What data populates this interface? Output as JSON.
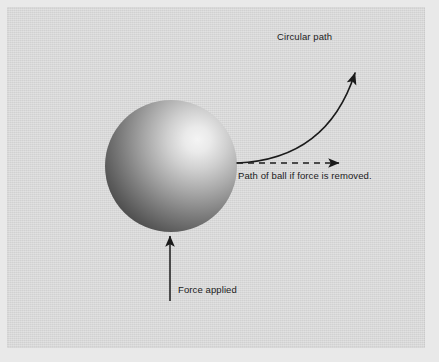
{
  "figure": {
    "type": "physics-diagram",
    "background_color": "#d6d6d6",
    "mat_color": "#e9e9e9",
    "ink_color": "#1b1b1b"
  },
  "labels": {
    "circular_path": "Circular path",
    "tangent_path": "Path of ball if force is removed.",
    "force_applied": "Force applied"
  },
  "ball": {
    "name": "ball",
    "center_x": 171,
    "center_y": 166,
    "radius": 66,
    "highlight_x": 198,
    "highlight_y": 128,
    "highlight_color": "#f2f2f2",
    "mid_color": "#9a9a9a",
    "edge_color": "#4a4a4a"
  },
  "arrows": {
    "circular_path": {
      "name": "circular-path-arrow",
      "style": "solid-curved",
      "start_x": 237,
      "start_y": 163,
      "end_x": 361,
      "end_y": 60,
      "color": "#1b1b1b"
    },
    "tangent_path": {
      "name": "tangent-path-arrow",
      "style": "dashed-straight",
      "start_x": 237,
      "start_y": 163,
      "end_x": 347,
      "end_y": 163,
      "color": "#1b1b1b"
    },
    "force_applied": {
      "name": "force-arrow",
      "style": "solid-straight",
      "start_x": 170,
      "start_y": 301,
      "end_x": 170,
      "end_y": 229,
      "color": "#1b1b1b"
    }
  }
}
